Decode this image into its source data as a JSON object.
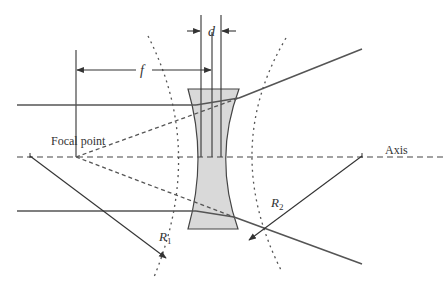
{
  "diagram": {
    "type": "concave-lens-ray-diagram",
    "labels": {
      "focal_length": "f",
      "thickness": "d",
      "focal_point": "Focal point",
      "axis": "Axis",
      "radius1": "R",
      "radius1_sub": "1",
      "radius2": "R",
      "radius2_sub": "2"
    },
    "colors": {
      "line": "#3a3a3a",
      "ray": "#555555",
      "lens_fill": "#d9d9d9",
      "lens_stroke": "#444444",
      "background": "#ffffff"
    }
  }
}
